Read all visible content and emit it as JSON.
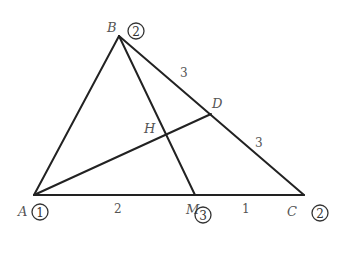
{
  "diagram": {
    "type": "triangle-mass-points",
    "points": {
      "A": {
        "label": "A",
        "weight": "1"
      },
      "B": {
        "label": "B",
        "weight": "2"
      },
      "C": {
        "label": "C",
        "weight": "2"
      },
      "M": {
        "label": "M",
        "weight": "3"
      },
      "D": {
        "label": "D"
      },
      "H": {
        "label": "H"
      }
    },
    "segments": [
      {
        "from": "A",
        "to": "B"
      },
      {
        "from": "B",
        "to": "C"
      },
      {
        "from": "A",
        "to": "C"
      },
      {
        "from": "B",
        "to": "M"
      },
      {
        "from": "A",
        "to": "D"
      }
    ],
    "lengths": {
      "AM": "2",
      "MC": "1",
      "BD": "3",
      "DC": "3"
    }
  }
}
